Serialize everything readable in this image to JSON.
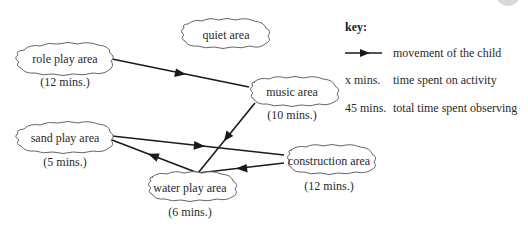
{
  "areas": [
    {
      "id": "role-play",
      "label": "role play area",
      "time": "(12 mins.)"
    },
    {
      "id": "quiet",
      "label": "quiet area",
      "time": ""
    },
    {
      "id": "music",
      "label": "music area",
      "time": "(10 mins.)"
    },
    {
      "id": "sand-play",
      "label": "sand play area",
      "time": "(5 mins.)"
    },
    {
      "id": "construction",
      "label": "construction area",
      "time": "(12 mins.)"
    },
    {
      "id": "water-play",
      "label": "water play area",
      "time": "(6 mins.)"
    }
  ],
  "movements": [
    {
      "from": "role play area",
      "to": "music area"
    },
    {
      "from": "music area",
      "to": "water play area"
    },
    {
      "from": "water play area",
      "to": "sand play area"
    },
    {
      "from": "sand play area",
      "to": "construction area"
    },
    {
      "from": "construction area",
      "to": "water play area"
    }
  ],
  "key": {
    "title": "key:",
    "items": [
      {
        "symbol": "arrow",
        "description": "movement of the child"
      },
      {
        "symbol": "x mins.",
        "description": "time spent on activity"
      },
      {
        "symbol": "45 mins.",
        "description": "total time spent observing"
      }
    ]
  },
  "colors": {
    "line": "#1a1a1a",
    "cloud_stroke": "#555555",
    "text": "#2a2a2a"
  }
}
